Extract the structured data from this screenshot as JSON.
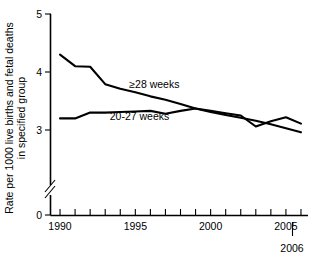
{
  "chart_data": {
    "type": "line",
    "title": "",
    "xlabel": "",
    "ylabel_line1": "Rate per 1000 live births and fetal deaths",
    "ylabel_line2": "in specified group",
    "x": [
      1990,
      1991,
      1992,
      1993,
      1994,
      1995,
      1996,
      1997,
      1998,
      1999,
      2000,
      2001,
      2002,
      2003,
      2004,
      2005,
      2006
    ],
    "xlim": [
      1989.4,
      2006.4
    ],
    "ylim": [
      3.0,
      5.0
    ],
    "y_broken_axis": true,
    "y_break_between": [
      0,
      2.7
    ],
    "y_tick_labels": [
      "5",
      "4",
      "3",
      "0"
    ],
    "y_tick_values": [
      5,
      4,
      3,
      0
    ],
    "x_tick_values": [
      1990,
      1991,
      1992,
      1993,
      1994,
      1995,
      1996,
      1997,
      1998,
      1999,
      2000,
      2001,
      2002,
      2003,
      2004,
      2005,
      2006
    ],
    "x_tick_labels": [
      "1990",
      "",
      "",
      "",
      "",
      "1995",
      "",
      "",
      "",
      "",
      "2000",
      "",
      "",
      "",
      "",
      "2005",
      ""
    ],
    "end_year_label": "2006",
    "grid": false,
    "legend_position": "inline-annotations",
    "series": [
      {
        "name": "≥28 weeks",
        "label": "≥28 weeks",
        "label_x": 1994.6,
        "label_y": 3.72,
        "values": [
          4.3,
          4.1,
          4.09,
          3.79,
          3.71,
          3.65,
          3.58,
          3.52,
          3.45,
          3.37,
          3.31,
          3.26,
          3.21,
          3.16,
          3.1,
          3.03,
          2.96
        ]
      },
      {
        "name": "20-27 weeks",
        "label": "20-27 weeks",
        "label_x": 1993.3,
        "label_y": 3.17,
        "values": [
          3.2,
          3.2,
          3.3,
          3.3,
          3.31,
          3.32,
          3.33,
          3.28,
          3.33,
          3.37,
          3.33,
          3.29,
          3.25,
          3.06,
          3.15,
          3.22,
          3.11
        ]
      }
    ],
    "colors": {
      "axis": "#000000",
      "series_1": "#000000",
      "series_2": "#000000",
      "background": "#ffffff"
    }
  }
}
